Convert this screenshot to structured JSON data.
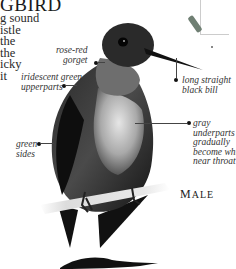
{
  "page": {
    "title": "GBIRD",
    "body_lines": [
      "g sound",
      "istle",
      "the",
      "the",
      "icky",
      "it"
    ]
  },
  "range_map": {
    "icon": "range-map-icon",
    "range_color": "#6f7f73"
  },
  "annotations": [
    {
      "id": "gorget",
      "lines": [
        "rose-red",
        "gorget"
      ]
    },
    {
      "id": "upperparts",
      "lines": [
        "iridescent green",
        "upperparts"
      ]
    },
    {
      "id": "bill",
      "lines": [
        "long straight",
        "black bill"
      ]
    },
    {
      "id": "sides",
      "lines": [
        "green",
        "sides"
      ]
    },
    {
      "id": "underparts",
      "lines": [
        "gray",
        "underparts",
        "gradually",
        "become white",
        "near throat"
      ]
    }
  ],
  "sex_label": {
    "first": "M",
    "rest": "ALE"
  },
  "illustration": {
    "subject": "hummingbird-male-perched",
    "second_subject": "hummingbird-in-flight"
  }
}
